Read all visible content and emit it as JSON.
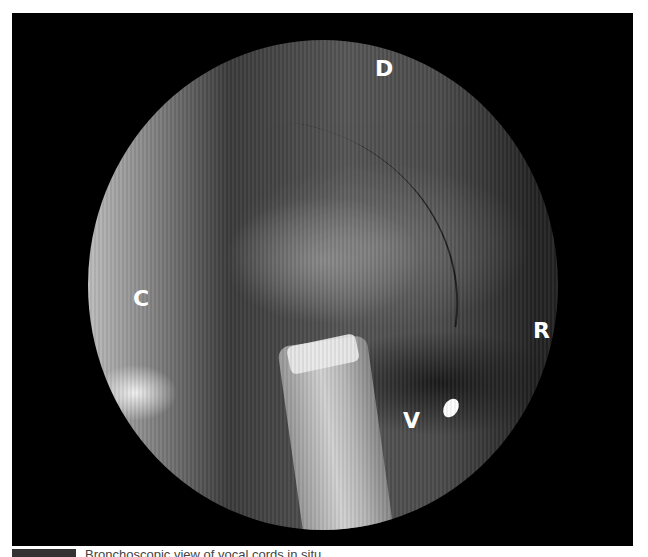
{
  "figure": {
    "labels": [
      {
        "id": "D",
        "text": "D",
        "x": 375,
        "y": 67
      },
      {
        "id": "C",
        "text": "C",
        "x": 133,
        "y": 297
      },
      {
        "id": "R",
        "text": "R",
        "x": 533,
        "y": 328
      },
      {
        "id": "V",
        "text": "V",
        "x": 403,
        "y": 418
      }
    ],
    "caption": {
      "text": "Bronchoscopic view of vocal cords in situ"
    }
  },
  "colors": {
    "background": "#ffffff",
    "frame": "#000000",
    "label": "#ffffff"
  }
}
